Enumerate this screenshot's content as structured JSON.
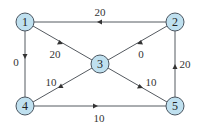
{
  "graph": {
    "nodes": [
      {
        "id": "1",
        "label": "1",
        "x": 25,
        "y": 22
      },
      {
        "id": "2",
        "label": "2",
        "x": 175,
        "y": 22
      },
      {
        "id": "3",
        "label": "3",
        "x": 100,
        "y": 64
      },
      {
        "id": "4",
        "label": "4",
        "x": 25,
        "y": 106
      },
      {
        "id": "5",
        "label": "5",
        "x": 175,
        "y": 106
      }
    ],
    "edges": [
      {
        "from": "2",
        "to": "1",
        "weight": "20"
      },
      {
        "from": "1",
        "to": "3",
        "weight": "20"
      },
      {
        "from": "2",
        "to": "3",
        "weight": "0"
      },
      {
        "from": "1",
        "to": "4",
        "weight": "0"
      },
      {
        "from": "3",
        "to": "4",
        "weight": "10"
      },
      {
        "from": "3",
        "to": "5",
        "weight": "10"
      },
      {
        "from": "4",
        "to": "5",
        "weight": "10"
      },
      {
        "from": "5",
        "to": "2",
        "weight": "20"
      }
    ]
  },
  "colors": {
    "node_fill": "#bfe0ef",
    "node_stroke": "#4a5560",
    "edge": "#555a60"
  }
}
